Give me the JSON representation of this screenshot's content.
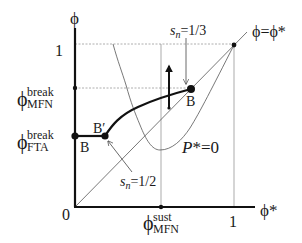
{
  "diagram": {
    "axes": {
      "y_label": "ϕ",
      "x_label": "ϕ*",
      "origin_label": "0",
      "y_tick_one": "1",
      "x_tick_one": "1"
    },
    "diagonal_label": "ϕ=ϕ*",
    "y_levels": {
      "mfn_break": {
        "base": "ϕ",
        "sup": "break",
        "sub": "MFN"
      },
      "fta_break": {
        "base": "ϕ",
        "sup": "break",
        "sub": "FTA"
      }
    },
    "x_levels": {
      "mfn_sust": {
        "base": "ϕ",
        "sup": "sust",
        "sub": "MFN"
      }
    },
    "points": {
      "b_left": "B",
      "b_prime": "B′",
      "b_upper": "B"
    },
    "curve_label": {
      "italic": "P",
      "rest": "*=0"
    },
    "annotations": {
      "sn_third": {
        "var": "s",
        "sub": "n",
        "rest": "=1/3"
      },
      "sn_half": {
        "var": "s",
        "sub": "n",
        "rest": "=1/2"
      }
    },
    "colors": {
      "ink": "#1a1a1a",
      "thin_line": "#555555",
      "dashed": "#888888"
    }
  }
}
